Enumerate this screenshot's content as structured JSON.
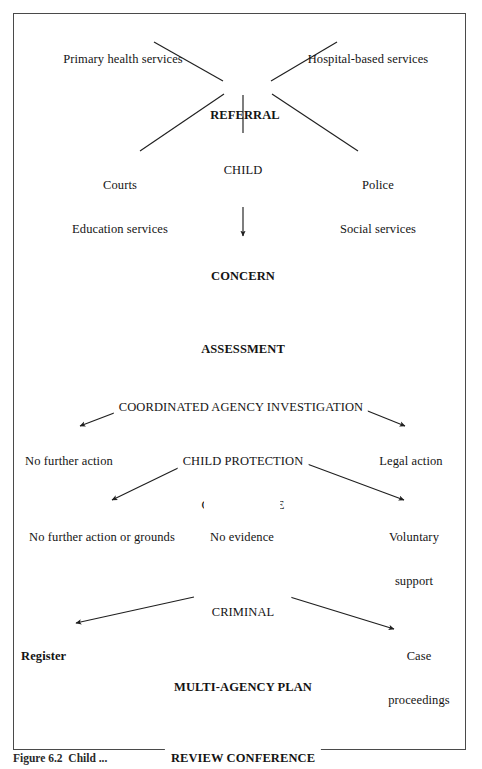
{
  "figure": {
    "caption": "Figure 6.2  Child ...",
    "frame_color": "#4a4a4a",
    "line_color": "#1f1f1f",
    "background": "#ffffff"
  },
  "chart_data": {
    "type": "diagram",
    "nodes": [
      {
        "id": "primary-health-services",
        "label": "Primary health services",
        "x": 123,
        "y": 28,
        "bold": false,
        "align": "center"
      },
      {
        "id": "hospital-based-services",
        "label": "Hospital-based services",
        "x": 368,
        "y": 28,
        "bold": false,
        "align": "center"
      },
      {
        "id": "referral",
        "label": "REFERRAL",
        "x": 245,
        "y": 84,
        "bold": true,
        "align": "center"
      },
      {
        "id": "child",
        "label": "CHILD",
        "x": 243,
        "y": 139,
        "bold": false,
        "align": "center"
      },
      {
        "id": "courts-education-services",
        "label": "Courts\nEducation services",
        "x": 120,
        "y": 154,
        "bold": false,
        "align": "center"
      },
      {
        "id": "police-social-services",
        "label": "Police\nSocial services",
        "x": 378,
        "y": 154,
        "bold": false,
        "align": "center"
      },
      {
        "id": "concern",
        "label": "CONCERN",
        "x": 243,
        "y": 245,
        "bold": true,
        "align": "center"
      },
      {
        "id": "assessment",
        "label": "ASSESSMENT",
        "x": 243,
        "y": 318,
        "bold": true,
        "align": "center"
      },
      {
        "id": "coordinated-agency-investigation",
        "label": "COORDINATED AGENCY INVESTIGATION",
        "x": 241,
        "y": 376,
        "bold": false,
        "align": "center"
      },
      {
        "id": "no-further-action",
        "label": "No further action",
        "x": 69,
        "y": 430,
        "bold": false,
        "align": "center"
      },
      {
        "id": "child-protection-conference",
        "label": "CHILD PROTECTION\nCONFERENCE",
        "x": 243,
        "y": 430,
        "bold": false,
        "align": "center"
      },
      {
        "id": "legal-action",
        "label": "Legal action",
        "x": 411,
        "y": 430,
        "bold": false,
        "align": "center"
      },
      {
        "id": "no-further-action-or-grounds",
        "label": "No further action or grounds",
        "x": 102,
        "y": 506,
        "bold": false,
        "align": "center"
      },
      {
        "id": "no-evidence",
        "label": "No evidence",
        "x": 242,
        "y": 506,
        "bold": false,
        "align": "center"
      },
      {
        "id": "voluntary-support",
        "label": "Voluntary\nsupport",
        "x": 414,
        "y": 506,
        "bold": false,
        "align": "center"
      },
      {
        "id": "criminal-proceedings",
        "label": "CRIMINAL\nPROCEEDINGS",
        "x": 243,
        "y": 581,
        "bold": false,
        "align": "center"
      },
      {
        "id": "register",
        "label": "Register",
        "x": 21,
        "y": 625,
        "bold": true,
        "align": "left"
      },
      {
        "id": "case-proceedings",
        "label": "Case\nproceedings",
        "x": 419,
        "y": 625,
        "bold": false,
        "align": "center"
      },
      {
        "id": "multi-agency-plan",
        "label": "MULTI-AGENCY PLAN",
        "x": 243,
        "y": 656,
        "bold": true,
        "align": "center"
      },
      {
        "id": "review-conference",
        "label": "REVIEW CONFERENCE",
        "x": 243,
        "y": 727,
        "bold": true,
        "align": "center"
      }
    ],
    "edges": [
      {
        "id": "edge-primary-health-to-referral",
        "from": "primary-health-services",
        "to": "referral",
        "arrow": false,
        "x1": 154,
        "y1": 42,
        "x2": 223,
        "y2": 81
      },
      {
        "id": "edge-hospital-to-referral",
        "from": "hospital-based-services",
        "to": "referral",
        "arrow": false,
        "x1": 337,
        "y1": 42,
        "x2": 271,
        "y2": 81
      },
      {
        "id": "edge-referral-to-courts",
        "from": "referral",
        "to": "courts-education-services",
        "arrow": false,
        "x1": 224,
        "y1": 94,
        "x2": 140,
        "y2": 151
      },
      {
        "id": "edge-referral-to-police",
        "from": "referral",
        "to": "police-social-services",
        "arrow": false,
        "x1": 272,
        "y1": 94,
        "x2": 358,
        "y2": 151
      },
      {
        "id": "edge-referral-to-child",
        "from": "referral",
        "to": "child",
        "arrow": false,
        "x1": 243,
        "y1": 95,
        "x2": 243,
        "y2": 135
      },
      {
        "id": "edge-child-to-concern",
        "from": "child",
        "to": "concern",
        "arrow": true,
        "x1": 243,
        "y1": 152,
        "x2": 243,
        "y2": 236
      },
      {
        "id": "edge-concern-to-assessment",
        "from": "concern",
        "to": "assessment",
        "arrow": true,
        "x1": 243,
        "y1": 262,
        "x2": 243,
        "y2": 310
      },
      {
        "id": "edge-assessment-to-investigation",
        "from": "assessment",
        "to": "coordinated-agency-investigation",
        "arrow": true,
        "x1": 243,
        "y1": 334,
        "x2": 243,
        "y2": 368
      },
      {
        "id": "edge-investigation-to-no-action",
        "from": "coordinated-agency-investigation",
        "to": "no-further-action",
        "arrow": true,
        "x1": 177,
        "y1": 389,
        "x2": 80,
        "y2": 426
      },
      {
        "id": "edge-investigation-to-conference",
        "from": "coordinated-agency-investigation",
        "to": "child-protection-conference",
        "arrow": true,
        "x1": 243,
        "y1": 389,
        "x2": 243,
        "y2": 425
      },
      {
        "id": "edge-investigation-to-legal",
        "from": "coordinated-agency-investigation",
        "to": "legal-action",
        "arrow": true,
        "x1": 313,
        "y1": 389,
        "x2": 405,
        "y2": 426
      },
      {
        "id": "edge-conference-to-no-grounds",
        "from": "child-protection-conference",
        "to": "no-further-action-or-grounds",
        "arrow": true,
        "x1": 205,
        "y1": 455,
        "x2": 112,
        "y2": 500
      },
      {
        "id": "edge-conference-to-no-evidence",
        "from": "child-protection-conference",
        "to": "no-evidence",
        "arrow": false,
        "x1": 243,
        "y1": 459,
        "x2": 243,
        "y2": 500
      },
      {
        "id": "edge-conference-to-voluntary",
        "from": "child-protection-conference",
        "to": "voluntary-support",
        "arrow": true,
        "x1": 283,
        "y1": 455,
        "x2": 404,
        "y2": 500
      },
      {
        "id": "edge-criminal-to-register",
        "from": "criminal-proceedings",
        "to": "register",
        "arrow": true,
        "x1": 194,
        "y1": 597,
        "x2": 76,
        "y2": 623
      },
      {
        "id": "edge-criminal-to-case",
        "from": "criminal-proceedings",
        "to": "case-proceedings",
        "arrow": true,
        "x1": 290,
        "y1": 597,
        "x2": 394,
        "y2": 629
      },
      {
        "id": "edge-criminal-to-plan",
        "from": "criminal-proceedings",
        "to": "multi-agency-plan",
        "arrow": true,
        "x1": 243,
        "y1": 604,
        "x2": 243,
        "y2": 648
      },
      {
        "id": "edge-plan-to-review",
        "from": "multi-agency-plan",
        "to": "review-conference",
        "arrow": true,
        "x1": 243,
        "y1": 668,
        "x2": 243,
        "y2": 719
      }
    ]
  }
}
